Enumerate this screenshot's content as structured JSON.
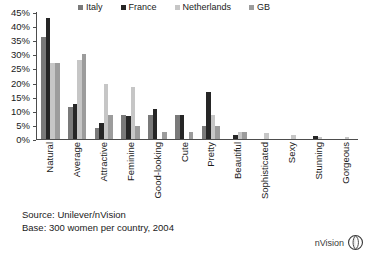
{
  "chart_data": {
    "type": "bar",
    "title": "",
    "xlabel": "",
    "ylabel": "",
    "ylim": [
      0,
      45
    ],
    "ytick_step": 5,
    "ytick_labels": [
      "0%",
      "5%",
      "10%",
      "15%",
      "20%",
      "25%",
      "30%",
      "35%",
      "40%",
      "45%"
    ],
    "grid": false,
    "legend_position": "top",
    "categories": [
      "Natural",
      "Average",
      "Attractive",
      "Feminine",
      "Good-looking",
      "Cute",
      "Pretty",
      "Beautiful",
      "Sophisticated",
      "Sexy",
      "Stunning",
      "Gorgeous"
    ],
    "series": [
      {
        "name": "Italy",
        "color": "#7a7a7a",
        "values": [
          36,
          11.5,
          4,
          8.5,
          8.5,
          8.5,
          4.5,
          0,
          0,
          0,
          0,
          0
        ]
      },
      {
        "name": "France",
        "color": "#262626",
        "values": [
          43,
          12.5,
          5.5,
          8,
          10.5,
          8.5,
          16.5,
          1.5,
          0,
          0,
          1,
          0
        ]
      },
      {
        "name": "Netherlands",
        "color": "#c6c6c6",
        "values": [
          27,
          28,
          19.5,
          18.5,
          0,
          0,
          8.5,
          2.5,
          2,
          1.5,
          0.7,
          0.8
        ]
      },
      {
        "name": "GB",
        "color": "#9c9c9c",
        "values": [
          27,
          30,
          8.5,
          4.5,
          2.5,
          2.5,
          4.5,
          2.5,
          0,
          0,
          0,
          0
        ]
      }
    ]
  },
  "footer": {
    "source": "Source: Unilever/nVision",
    "base": "Base: 300 women per country, 2004"
  },
  "brand": {
    "name": "nVision",
    "logo_icon": "nvision-leaf-circle-logo"
  }
}
